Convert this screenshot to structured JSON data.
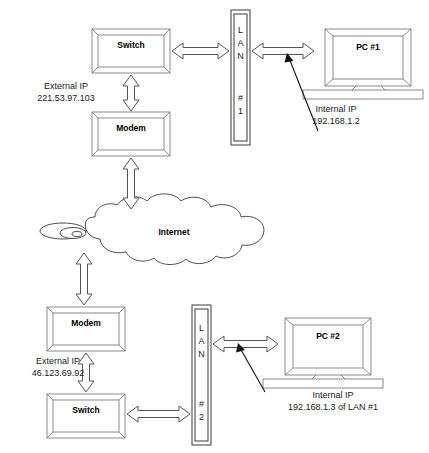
{
  "diagram": {
    "colors": {
      "background": "#ffffff",
      "outline": "#3a3a3a",
      "bevel": "#6e6e6e",
      "arrow_outline": "#555555",
      "text": "#000000",
      "pointer": "#111111"
    },
    "top_network": {
      "switch": {
        "label": "Switch"
      },
      "modem": {
        "label": "Modem"
      },
      "lan": {
        "label_chars": [
          "L",
          "A",
          "N"
        ],
        "number_chars": [
          "#",
          "1"
        ],
        "name": "LAN #1"
      },
      "pc": {
        "label": "PC #1"
      },
      "external_ip": {
        "line1": "External IP",
        "line2": "221.53.97.103"
      },
      "internal_ip": {
        "line1": "Internal IP",
        "line2": "192.168.1.2"
      }
    },
    "internet": {
      "label": "Internet"
    },
    "bottom_network": {
      "modem": {
        "label": "Modem"
      },
      "switch": {
        "label": "Switch"
      },
      "lan": {
        "label_chars": [
          "L",
          "A",
          "N"
        ],
        "number_chars": [
          "#",
          "2"
        ],
        "name": "LAN #2"
      },
      "pc": {
        "label": "PC #2"
      },
      "external_ip": {
        "line1": "External IP",
        "line2": "46.123.69.92"
      },
      "internal_ip": {
        "line1": "Internal IP",
        "line2": "192.168.1.3 of LAN #1"
      }
    }
  }
}
